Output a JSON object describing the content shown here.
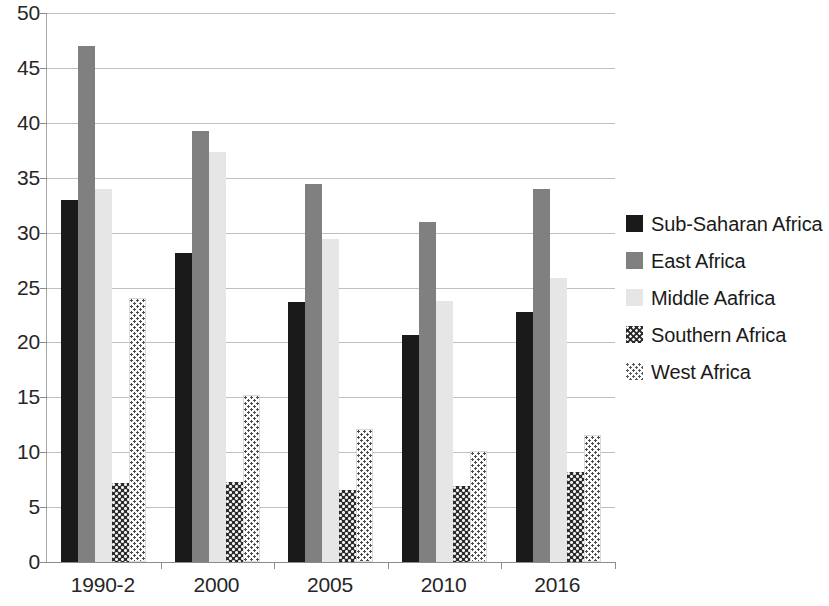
{
  "chart_data": {
    "type": "bar",
    "title": "",
    "subtitle": "",
    "xlabel": "",
    "ylabel": "",
    "categories": [
      "1990-2",
      "2000",
      "2005",
      "2010",
      "2016"
    ],
    "series": [
      {
        "name": "Sub-Saharan Africa",
        "color": "#1a1a1a",
        "pattern": "solid-black",
        "values": [
          33.0,
          28.1,
          23.7,
          20.7,
          22.8
        ]
      },
      {
        "name": "East Africa",
        "color": "#808080",
        "pattern": "solid-gray",
        "values": [
          47.0,
          39.3,
          34.4,
          31.0,
          34.0
        ]
      },
      {
        "name": "Middle Aafrica",
        "color": "#e6e6e6",
        "pattern": "solid-light-gray",
        "values": [
          34.0,
          37.3,
          29.4,
          23.8,
          25.9
        ]
      },
      {
        "name": "Southern Africa",
        "color": "#2b2b2b",
        "pattern": "dark-checkered-dots",
        "values": [
          7.2,
          7.3,
          6.6,
          6.9,
          8.2
        ]
      },
      {
        "name": "West Africa",
        "color": "#ffffff",
        "pattern": "light-speckled-dots",
        "values": [
          24.0,
          15.2,
          12.1,
          10.1,
          11.6
        ]
      }
    ],
    "ylim": [
      0,
      50
    ],
    "ytick_step": 5,
    "ytick_labels": [
      "0",
      "5",
      "10",
      "15",
      "20",
      "25",
      "30",
      "35",
      "40",
      "45",
      "50"
    ],
    "grid": true,
    "grid_axis": "y",
    "legend_position": "right",
    "legend_entries": [
      "Sub-Saharan Africa",
      "East Africa",
      "Middle Aafrica",
      "Southern Africa",
      "West Africa"
    ]
  }
}
